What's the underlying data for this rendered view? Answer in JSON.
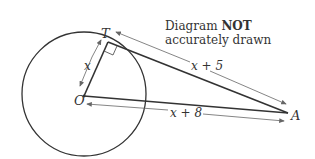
{
  "diagram": {
    "note_line1_normal": "Diagram ",
    "note_line1_bold": "NOT",
    "note_line2": "accurately drawn",
    "points": {
      "T": "T",
      "O": "O",
      "A": "A"
    },
    "lengths": {
      "OT": "x",
      "TA": "x + 5",
      "OA": "x + 8"
    },
    "colors": {
      "line": "#333333",
      "arrow": "#666666"
    }
  }
}
